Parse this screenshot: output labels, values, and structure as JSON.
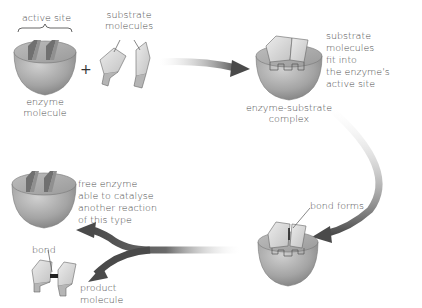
{
  "diagram": {
    "type": "process-flow",
    "colors": {
      "enzyme_fill": "#a8a8a8",
      "enzyme_top": "#c4c4c4",
      "substrate_fill": "#dcdcdc",
      "arrow_dark": "#4a4a4a",
      "bond": "#222222",
      "text": "#4d4d4d"
    },
    "labels": {
      "active_site": "active site",
      "substrate_line1": "substrate",
      "substrate_line2": "molecules",
      "plus": "+",
      "enzyme_line1": "enzyme",
      "enzyme_line2": "molecule",
      "complex_line1": "enzyme-substrate",
      "complex_line2": "complex",
      "fit_line1": "substrate",
      "fit_line2": "molecules",
      "fit_line3": "fit into",
      "fit_line4": "the enzyme's",
      "fit_line5": "active site",
      "bond_forms": "bond forms",
      "free_line1": "free enzyme",
      "free_line2": "able to catalyse",
      "free_line3": "another reaction",
      "free_line4": "of this type",
      "bond": "bond",
      "product_line1": "product",
      "product_line2": "molecule"
    },
    "nodes": [
      {
        "id": "enzyme",
        "label": "enzyme molecule"
      },
      {
        "id": "substrates",
        "label": "substrate molecules"
      },
      {
        "id": "complex",
        "label": "enzyme-substrate complex"
      },
      {
        "id": "bond-forming",
        "label": "bond forms"
      },
      {
        "id": "free-enzyme",
        "label": "free enzyme able to catalyse another reaction of this type"
      },
      {
        "id": "product",
        "label": "product molecule"
      }
    ],
    "edges": [
      {
        "from": "substrates",
        "to": "complex"
      },
      {
        "from": "complex",
        "to": "bond-forming"
      },
      {
        "from": "bond-forming",
        "to": "free-enzyme"
      },
      {
        "from": "bond-forming",
        "to": "product"
      }
    ]
  }
}
